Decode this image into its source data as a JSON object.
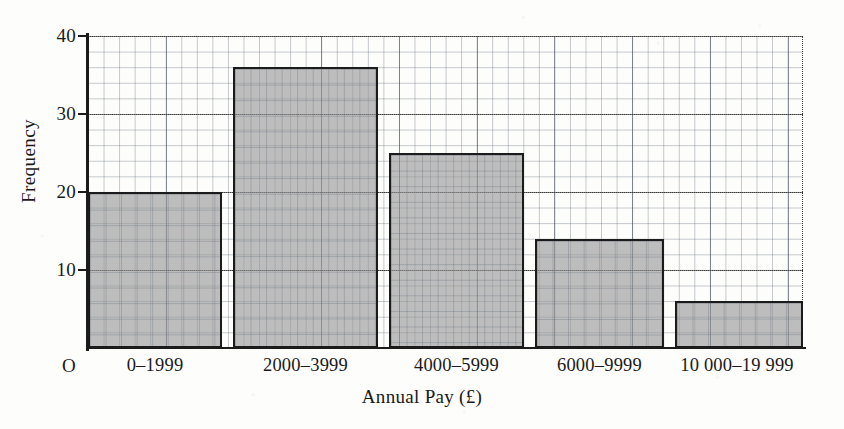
{
  "chart_data": {
    "type": "bar",
    "title": "",
    "subtitle": "",
    "xlabel": "Annual Pay (£)",
    "ylabel": "Frequency",
    "categories": [
      "0–1999",
      "2000–3999",
      "4000–5999",
      "6000–9999",
      "10 000–19 999"
    ],
    "values": [
      20,
      36,
      25,
      14,
      6
    ],
    "ylim": [
      0,
      40
    ],
    "y_ticks": [
      "40",
      "30",
      "20",
      "10"
    ],
    "y_tick_values": [
      40,
      30,
      20,
      10
    ],
    "origin_label": "O",
    "grid": true,
    "grid_minor_step": 2,
    "grid_major_step": 10,
    "legend": null,
    "annotations": [],
    "bar_fill_color": "#969696",
    "bar_edge_color": "#1b1b1b",
    "grid_color": "#5a6473",
    "axis_color": "#1b1b1b",
    "background_color": "#fdfdfb"
  }
}
